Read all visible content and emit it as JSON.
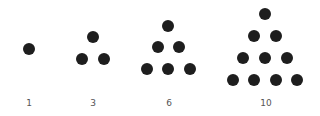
{
  "dot_color": "#1e1e1e",
  "label_color": "#555555",
  "dot_radius": 6,
  "groups": [
    {
      "label": "1",
      "label_x": 29,
      "dots": [
        [
          29,
          49
        ]
      ]
    },
    {
      "label": "3",
      "label_x": 93,
      "dots": [
        [
          93,
          37
        ],
        [
          82,
          59
        ],
        [
          104,
          59
        ]
      ]
    },
    {
      "label": "6",
      "label_x": 169,
      "dots": [
        [
          168,
          26
        ],
        [
          158,
          47
        ],
        [
          179,
          47
        ],
        [
          147,
          69
        ],
        [
          168,
          69
        ],
        [
          190,
          69
        ]
      ]
    },
    {
      "label": "10",
      "label_x": 266,
      "dots": [
        [
          265,
          14
        ],
        [
          254,
          36
        ],
        [
          276,
          36
        ],
        [
          243,
          58
        ],
        [
          265,
          58
        ],
        [
          287,
          58
        ],
        [
          233,
          80
        ],
        [
          254,
          80
        ],
        [
          276,
          80
        ],
        [
          297,
          80
        ]
      ]
    }
  ],
  "label_y": 98
}
